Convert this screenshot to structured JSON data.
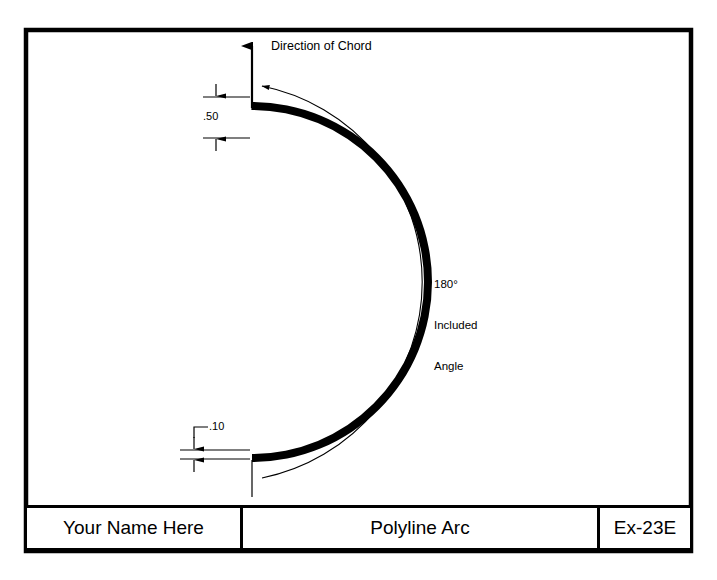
{
  "sheet": {
    "border_color": "#000000",
    "background": "#ffffff"
  },
  "drawing": {
    "chord_arrow_label": "Direction of Chord",
    "angle_label_line1": "180°",
    "angle_label_line2": "Included",
    "angle_label_line3": "Angle",
    "dimension_top": ".50",
    "dimension_bottom": ".10",
    "arc_fill_color": "#000000",
    "leader_color": "#000000"
  },
  "title_block": {
    "name": "Your Name Here",
    "title": "Polyline Arc",
    "number": "Ex-23E"
  }
}
